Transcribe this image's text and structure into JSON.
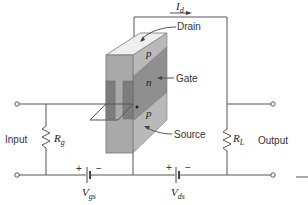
{
  "diagram": {
    "labels": {
      "drain": "Drain",
      "gate": "Gate",
      "source": "Source",
      "input": "Input",
      "output": "Output"
    },
    "regions": {
      "top": "p",
      "middle": "n",
      "bottom": "p"
    },
    "components": {
      "rg": {
        "symbol": "R",
        "sub": "g"
      },
      "rl": {
        "symbol": "R",
        "sub": "L"
      },
      "vgs": {
        "symbol": "V",
        "sub": "gs",
        "plus": "+",
        "minus": "−"
      },
      "vds": {
        "symbol": "V",
        "sub": "ds",
        "plus": "+",
        "minus": "−"
      },
      "id": {
        "symbol": "I",
        "sub": "d"
      }
    },
    "colors": {
      "front_face": "#a9a9a9",
      "top_face": "#efefef",
      "side_p": "#b9b9b9",
      "side_n": "#8f8f8f",
      "gate_contact": "#7d7d7d",
      "wire": "#555555"
    }
  }
}
